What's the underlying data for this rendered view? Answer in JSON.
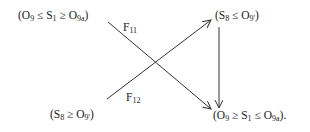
{
  "diagram": {
    "nodes": {
      "top_left": {
        "parts": [
          "(O",
          "9",
          " ≤ S",
          "1",
          " ≥ O",
          "9a",
          ")"
        ]
      },
      "top_right": {
        "parts": [
          "(S",
          "8",
          " ≤ O",
          "9'",
          ")"
        ]
      },
      "bottom_left": {
        "parts": [
          "(S",
          "8",
          " ≥ O",
          "9'",
          ")"
        ]
      },
      "bottom_right": {
        "parts": [
          "(O",
          "9",
          " ≥ S",
          "1",
          " ≤ O",
          "9a",
          ")."
        ]
      }
    },
    "edges": [
      {
        "from": "top_left",
        "to": "bottom_right",
        "label_main": "F",
        "label_sub": "11"
      },
      {
        "from": "bottom_left",
        "to": "top_right",
        "label_main": "F",
        "label_sub": "12"
      },
      {
        "from": "top_right",
        "to": "bottom_right",
        "label_main": "",
        "label_sub": ""
      }
    ],
    "colors": {
      "line": "#333333",
      "text": "#222222"
    }
  }
}
